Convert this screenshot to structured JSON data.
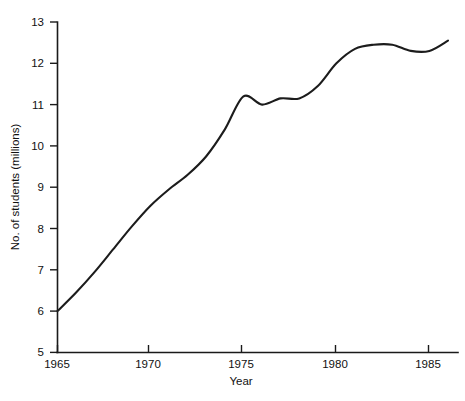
{
  "chart_data": {
    "type": "line",
    "title": "",
    "xlabel": "Year",
    "ylabel": "No. of students (millions)",
    "xlim": [
      1965,
      1986
    ],
    "ylim": [
      5,
      13
    ],
    "xticks": [
      1965,
      1970,
      1975,
      1980,
      1985
    ],
    "xtick_labels": [
      "1965",
      "1970",
      "1975",
      "1980",
      "1985"
    ],
    "yticks": [
      5,
      6,
      7,
      8,
      9,
      10,
      11,
      12,
      13
    ],
    "ytick_labels": [
      "5",
      "6",
      "7",
      "8",
      "9",
      "10",
      "11",
      "12",
      "13"
    ],
    "grid": false,
    "legend": null,
    "series": [
      {
        "name": "No. of students",
        "color": "#1c1c1c",
        "x": [
          1965,
          1966,
          1967,
          1968,
          1969,
          1970,
          1971,
          1972,
          1973,
          1974,
          1975,
          1976,
          1977,
          1978,
          1979,
          1980,
          1981,
          1982,
          1983,
          1984,
          1985,
          1986
        ],
        "values": [
          6.0,
          6.45,
          6.95,
          7.5,
          8.05,
          8.55,
          8.95,
          9.3,
          9.75,
          10.4,
          11.2,
          11.0,
          11.15,
          11.15,
          11.45,
          12.0,
          12.35,
          12.45,
          12.45,
          12.3,
          12.3,
          12.55
        ]
      }
    ]
  },
  "axes": {
    "x_axis_label": "Year",
    "y_axis_label": "No. of students (millions)"
  }
}
